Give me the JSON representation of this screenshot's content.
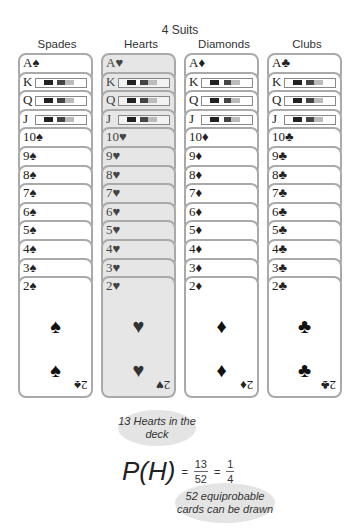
{
  "title": "4 Suits",
  "columns": [
    {
      "name": "Spades",
      "symbol": "♠",
      "highlighted": false,
      "ranks": [
        "A",
        "K",
        "Q",
        "J",
        "10",
        "9",
        "8",
        "7",
        "6",
        "5",
        "4",
        "3",
        "2"
      ]
    },
    {
      "name": "Hearts",
      "symbol": "♥",
      "highlighted": true,
      "ranks": [
        "A",
        "K",
        "Q",
        "J",
        "10",
        "9",
        "8",
        "7",
        "6",
        "5",
        "4",
        "3",
        "2"
      ]
    },
    {
      "name": "Diamonds",
      "symbol": "♦",
      "highlighted": false,
      "ranks": [
        "A",
        "K",
        "Q",
        "J",
        "10",
        "9",
        "8",
        "7",
        "6",
        "5",
        "4",
        "3",
        "2"
      ]
    },
    {
      "name": "Clubs",
      "symbol": "♣",
      "highlighted": false,
      "ranks": [
        "A",
        "K",
        "Q",
        "J",
        "10",
        "9",
        "8",
        "7",
        "6",
        "5",
        "4",
        "3",
        "2"
      ]
    }
  ],
  "labels": {
    "spades_head": "Spades",
    "hearts_head": "Hearts",
    "diamonds_head": "Diamonds",
    "clubs_head": "Clubs"
  },
  "formula": {
    "lhs": "P(H)",
    "eq1": "=",
    "num1": "13",
    "den1": "52",
    "eq2": "=",
    "num2": "1",
    "den2": "4"
  },
  "callouts": {
    "top": "13 Hearts in the deck",
    "bottom": "52 equiprobable cards can be drawn"
  },
  "colors": {
    "highlight_bg": "#e6e6e6",
    "card_border": "#a9a9a9",
    "bubble": "#e4e4e4"
  }
}
